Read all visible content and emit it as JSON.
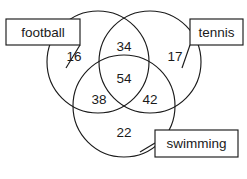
{
  "diagram": {
    "type": "venn-3-set",
    "title": "",
    "stroke_color": "#1a1a1a",
    "background_color": "#ffffff",
    "sets": [
      {
        "id": "football",
        "label": "football",
        "label_box_x": 6,
        "label_box_y": 19,
        "label_box_w": 74,
        "label_box_h": 26,
        "circle_cx": 98,
        "circle_cy": 62,
        "circle_r": 51
      },
      {
        "id": "tennis",
        "label": "tennis",
        "label_box_x": 190,
        "label_box_y": 19,
        "label_box_w": 53,
        "label_box_h": 26,
        "circle_cx": 150,
        "circle_cy": 62,
        "circle_r": 51
      },
      {
        "id": "swimming",
        "label": "swimming",
        "label_box_x": 155,
        "label_box_y": 130,
        "label_box_w": 83,
        "label_box_h": 27,
        "circle_cx": 124,
        "circle_cy": 106,
        "circle_r": 51
      }
    ],
    "regions": [
      {
        "id": "football-only",
        "value": "16",
        "x": 74,
        "y": 57
      },
      {
        "id": "football-tennis",
        "value": "34",
        "x": 124,
        "y": 47
      },
      {
        "id": "tennis-only",
        "value": "17",
        "x": 175,
        "y": 57
      },
      {
        "id": "all-three",
        "value": "54",
        "x": 124,
        "y": 79
      },
      {
        "id": "football-swimming",
        "value": "38",
        "x": 99,
        "y": 100
      },
      {
        "id": "tennis-swimming",
        "value": "42",
        "x": 150,
        "y": 100
      },
      {
        "id": "swimming-only",
        "value": "22",
        "x": 124,
        "y": 133
      }
    ],
    "leaders": [
      {
        "id": "football-leader",
        "x1": 80,
        "y1": 45,
        "x2": 66,
        "y2": 68
      },
      {
        "id": "tennis-leader",
        "x1": 190,
        "y1": 45,
        "x2": 182,
        "y2": 68
      },
      {
        "id": "swimming-leader",
        "x1": 155,
        "y1": 143,
        "x2": 140,
        "y2": 152
      }
    ]
  }
}
